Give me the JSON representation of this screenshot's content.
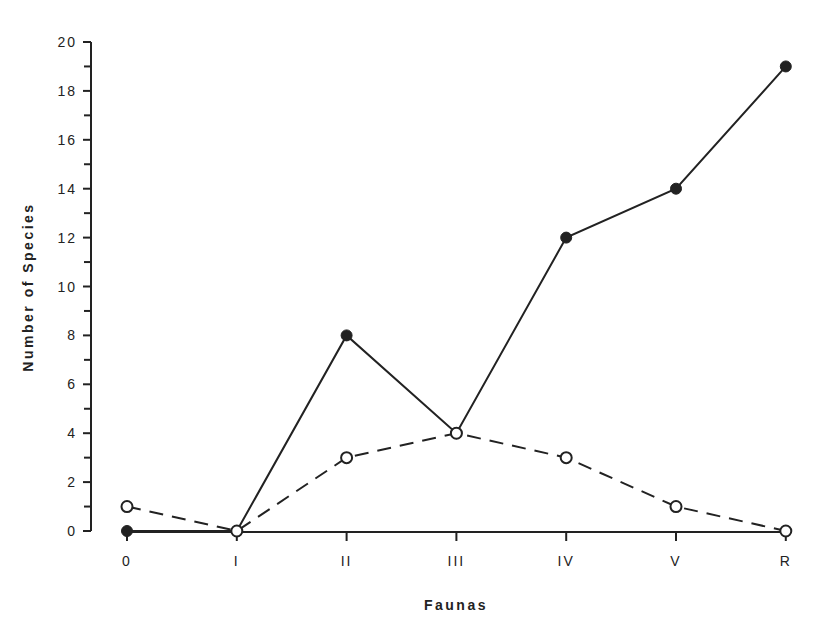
{
  "chart_data": {
    "type": "line",
    "title": "",
    "xlabel": "Faunas",
    "ylabel": "Number of Species",
    "categories": [
      "0",
      "I",
      "II",
      "III",
      "IV",
      "V",
      "R"
    ],
    "series": [
      {
        "name": "Series A (filled circles, solid line)",
        "marker": "filled-circle",
        "line": "solid",
        "values": [
          0,
          0,
          8,
          4,
          12,
          14,
          19
        ]
      },
      {
        "name": "Series B (open circles, dashed line)",
        "marker": "open-circle",
        "line": "dashed",
        "values": [
          1,
          0,
          3,
          4,
          3,
          1,
          0
        ]
      }
    ],
    "ylim": [
      0,
      20
    ],
    "yticks_major": [
      0,
      2,
      4,
      6,
      8,
      10,
      12,
      14,
      16,
      18,
      20
    ],
    "yticks_minor": [
      1,
      3,
      5,
      7,
      9,
      11,
      13,
      15,
      17,
      19
    ],
    "grid": false,
    "legend": null
  },
  "colors": {
    "ink": "#222222",
    "background": "#ffffff"
  }
}
